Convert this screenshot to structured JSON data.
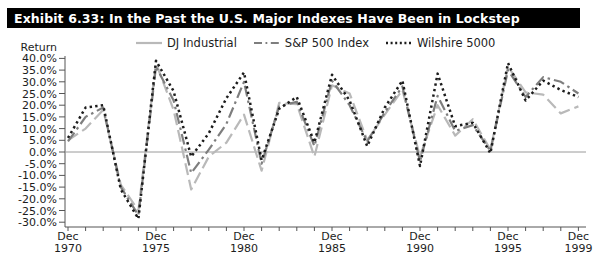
{
  "title": "Exhibit 6.33: In the Past the U.S. Major Indexes Have Been in Lockstep",
  "colors": {
    "title_bg": "#000000",
    "title_fg": "#ffffff",
    "axis": "#555555",
    "tick_text": "#1d1d1d",
    "zero_line": "#9a9a9a",
    "background": "#ffffff"
  },
  "chart_data": {
    "type": "line",
    "title": "Exhibit 6.33: In the Past the U.S. Major Indexes Have Been in Lockstep",
    "ylabel": "Return",
    "xlabel": "",
    "ylim": [
      -30,
      40
    ],
    "ytick_step": 5,
    "grid": "zero-line-only",
    "legend_position": "top",
    "ytick_values": [
      40,
      35,
      30,
      25,
      20,
      15,
      10,
      5,
      0,
      -5,
      -10,
      -15,
      -20,
      -25,
      -30
    ],
    "ytick_labels": [
      "40.0%",
      "35.0%",
      "30.0%",
      "25.0%",
      "20.0%",
      "15.0%",
      "10.0%",
      "5.0%",
      "0.0%",
      "-5.0%",
      "-10.0%",
      "-15.0%",
      "-20.0%",
      "-25.0%",
      "-30.0%"
    ],
    "x_years": [
      1970,
      1971,
      1972,
      1973,
      1974,
      1975,
      1976,
      1977,
      1978,
      1979,
      1980,
      1981,
      1982,
      1983,
      1984,
      1985,
      1986,
      1987,
      1988,
      1989,
      1990,
      1991,
      1992,
      1993,
      1994,
      1995,
      1996,
      1997,
      1998,
      1999
    ],
    "xtick_labels": [
      {
        "year": 1970,
        "line1": "Dec",
        "line2": "1970"
      },
      {
        "year": 1975,
        "line1": "Dec",
        "line2": "1975"
      },
      {
        "year": 1980,
        "line1": "Dec",
        "line2": "1980"
      },
      {
        "year": 1985,
        "line1": "Dec",
        "line2": "1985"
      },
      {
        "year": 1990,
        "line1": "Dec",
        "line2": "1990"
      },
      {
        "year": 1995,
        "line1": "Dec",
        "line2": "1995"
      },
      {
        "year": 1999,
        "line1": "Dec",
        "line2": "1999"
      }
    ],
    "series": [
      {
        "name": "DJ Industrial",
        "color": "#b9b9b9",
        "dash": "12 5",
        "legend_dash": "",
        "width": 2.2,
        "values": [
          5,
          10,
          18,
          -14,
          -25,
          38,
          18,
          -16,
          -2,
          4,
          16,
          -8,
          21,
          20.5,
          -2,
          28.5,
          25,
          5,
          16,
          26.5,
          -2,
          20,
          7,
          14,
          1,
          36.5,
          25.5,
          24.5,
          16.5,
          19.5
        ]
      },
      {
        "name": "S&P 500 Index",
        "color": "#7e7e7e",
        "dash": "11 4 2.5 4",
        "legend_dash": "8 3.5 1.8 3.5",
        "width": 2.2,
        "values": [
          4.5,
          15,
          19,
          -15,
          -27,
          36.5,
          22,
          -9,
          1,
          12,
          30,
          -5,
          19.5,
          21.5,
          2.5,
          30.5,
          20,
          4.5,
          17,
          28,
          -4,
          24,
          9,
          11.5,
          0.5,
          35,
          23.5,
          32,
          30,
          25
        ]
      },
      {
        "name": "Wilshire 5000",
        "color": "#1c1c1c",
        "dash": "2.4 3.2",
        "legend_dash": "2 2.6",
        "width": 2.5,
        "values": [
          6,
          19,
          20,
          -16,
          -28.5,
          39,
          26,
          -2,
          8,
          23,
          34,
          -3.5,
          18.5,
          23.5,
          4,
          33,
          22,
          2.5,
          19,
          30.5,
          -6,
          33.5,
          11,
          12.5,
          -0.5,
          38,
          22,
          30.5,
          26.5,
          23.5
        ]
      }
    ]
  }
}
